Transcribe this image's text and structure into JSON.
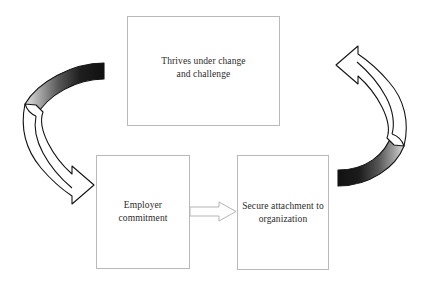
{
  "diagram": {
    "background_color": "#ffffff",
    "box_border_color": "#b9b9b9",
    "text_color": "#2b2b2b",
    "arrow_outline_color": "#1a1a1a",
    "arrow_ribbon_dark": "#141414",
    "arrow_ribbon_light": "#d8d8d8",
    "straight_arrow_color": "#b5b5b5",
    "nodes": [
      {
        "id": "thrives",
        "label": "Thrives under change\nand challenge"
      },
      {
        "id": "employer",
        "label": "Employer\ncommitment"
      },
      {
        "id": "secure",
        "label": "Secure attachment to\norganization"
      }
    ],
    "connectors": [
      {
        "id": "left-curved-arrow",
        "name": "curved-arrow-left",
        "from": "thrives",
        "to": "employer",
        "style": "3d-curved-ribbon",
        "direction": "down-right"
      },
      {
        "id": "straight-arrow",
        "name": "straight-arrow-employer-to-secure",
        "from": "employer",
        "to": "secure",
        "style": "block-arrow",
        "direction": "right"
      },
      {
        "id": "right-curved-arrow",
        "name": "curved-arrow-right",
        "from": "secure",
        "to": "thrives",
        "style": "3d-curved-ribbon",
        "direction": "up-left"
      }
    ]
  }
}
